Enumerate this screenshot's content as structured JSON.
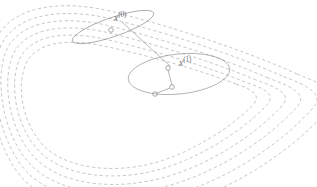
{
  "figure": {
    "title": "",
    "background_color": "#ffffff",
    "width": 317,
    "height": 187
  },
  "labels": {
    "iterate_0": {
      "variable": "x",
      "superscript": "(0)"
    },
    "iterate_1": {
      "variable": "x",
      "superscript": "(1)"
    }
  },
  "colors": {
    "contour_stroke": "#b9b9bd",
    "ellipse_stroke": "#909093",
    "line_stroke": "#8a8a8e",
    "marker_stroke": "#7d7d82",
    "label_text": "#6f6f74"
  },
  "chart_data": {
    "type": "line",
    "title": "",
    "subtitle": "",
    "xlabel": "",
    "ylabel": "",
    "xlim": [
      0,
      317
    ],
    "ylim": [
      0,
      187
    ],
    "grid": false,
    "legend": null,
    "contours": [
      {
        "level": 1,
        "path": "M 236 84 C 200 70 150 56 104 46 C 66 38 34 42 25 66 C 16 90 24 126 44 146 C 62 164 96 172 134 167 C 180 161 228 130 252 106 C 262 96 254 90 236 84 Z"
      },
      {
        "level": 2,
        "path": "M 245 82 C 206 66 152 50 104 39 C 62 30 27 36 18 63 C 9 90 18 130 40 152 C 60 172 98 180 138 174 C 188 167 240 133 266 106 C 277 95 266 89 245 82 Z"
      },
      {
        "level": 3,
        "path": "M 256 80 C 214 62 155 44 105 32 C 58 22 20 30 11 60 C 2 90 12 135 36 159 C 58 181 100 189 143 182 C 197 174 253 137 281 107 C 293 95 279 88 256 80 Z"
      },
      {
        "level": 4,
        "path": "M 268 78 C 223 58 159 38 106 25 C 54 14 13 24 4 57 C -5 90 6 140 32 166 C 56 190 102 198 148 190 C 206 181 266 141 296 108 C 309 95 293 87 268 78 Z"
      },
      {
        "level": 5,
        "path": "M 282 76 C 233 54 164 32 108 18 C 51 6 7 18 -2 54 C -11 90 1 145 28 173 C 54 199 105 208 154 199 C 216 189 280 145 312 109 C 326 95 309 86 282 76 Z"
      },
      {
        "level": 6,
        "path": "M 297 74 C 244 50 170 26 110 11 C 48 -3 1 11 -8 51 C -17 90 -4 150 24 180 C 52 208 108 218 160 208 C 226 197 294 149 328 110 C 343 95 326 85 297 74 Z"
      }
    ],
    "trust_regions": [
      {
        "name": "trust-region-0",
        "iterate": "x^(0)",
        "cx": 113,
        "cy": 27,
        "rx": 43,
        "ry": 9.5,
        "rotation_deg": -19
      },
      {
        "name": "trust-region-1",
        "iterate": "x^(1)",
        "cx": 179,
        "cy": 74,
        "rx": 51,
        "ry": 20,
        "rotation_deg": -6
      }
    ],
    "markers": [
      {
        "name": "marker-a",
        "x": 111,
        "y": 30,
        "r": 2.3
      },
      {
        "name": "marker-b",
        "x": 168,
        "y": 68,
        "r": 2.3
      },
      {
        "name": "marker-c",
        "x": 172,
        "y": 87,
        "r": 2.3
      },
      {
        "name": "marker-d",
        "x": 155,
        "y": 94,
        "r": 2.3
      }
    ],
    "segments": [
      {
        "name": "segment-x0-to-x1",
        "x1": 122,
        "y1": 22,
        "x2": 170,
        "y2": 66
      },
      {
        "name": "segment-b-to-c",
        "x1": 168,
        "y1": 70,
        "x2": 172,
        "y2": 85
      },
      {
        "name": "segment-c-to-d",
        "x1": 170,
        "y1": 88,
        "x2": 157,
        "y2": 93
      }
    ]
  }
}
